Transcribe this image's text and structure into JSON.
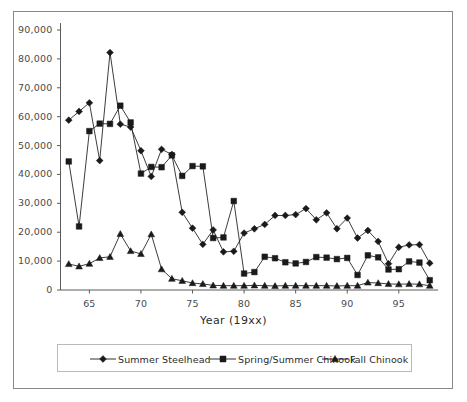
{
  "chart_data": {
    "type": "line",
    "title": "",
    "subtitle": "",
    "xlabel": "Year  (19xx)",
    "ylabel": "",
    "xlim": [
      62.2,
      98.8
    ],
    "ylim": [
      0,
      90000
    ],
    "grid": false,
    "legend_position": "bottom",
    "y_ticks": [
      0,
      10000,
      20000,
      30000,
      40000,
      50000,
      60000,
      70000,
      80000,
      90000
    ],
    "y_tick_labels": [
      "0",
      "10,000",
      "20,000",
      "30,000",
      "40,000",
      "50,000",
      "60,000",
      "70,000",
      "80,000",
      "90,000"
    ],
    "x_ticks": [
      65,
      70,
      75,
      80,
      85,
      90,
      95
    ],
    "x_tick_labels": [
      "65",
      "70",
      "75",
      "80",
      "85",
      "90",
      "95"
    ],
    "x": [
      63,
      64,
      65,
      66,
      67,
      68,
      69,
      70,
      71,
      72,
      73,
      74,
      75,
      76,
      77,
      78,
      79,
      80,
      81,
      82,
      83,
      84,
      85,
      86,
      87,
      88,
      89,
      90,
      91,
      92,
      93,
      94,
      95,
      96,
      97,
      98
    ],
    "series": [
      {
        "name": "Summer Steelhead",
        "marker": "diamond",
        "color": "#1a1a1a",
        "values": [
          58800,
          61800,
          64800,
          44800,
          82200,
          57400,
          56400,
          48200,
          39300,
          48700,
          46900,
          26900,
          21400,
          15800,
          20800,
          13200,
          13400,
          19700,
          21200,
          22700,
          25800,
          25800,
          26100,
          28200,
          24300,
          26700,
          21200,
          24900,
          18000,
          20600,
          16800,
          9100,
          14800,
          15600,
          15700,
          9300
        ]
      },
      {
        "name": "Spring/Summer Chinook",
        "marker": "square",
        "color": "#1a1a1a",
        "values": [
          44500,
          22000,
          55000,
          57600,
          57500,
          63800,
          58000,
          40300,
          42600,
          42500,
          46600,
          39500,
          42900,
          42800,
          18000,
          18200,
          30800,
          5700,
          6200,
          11500,
          11000,
          9600,
          9200,
          9700,
          11400,
          11200,
          10700,
          11100,
          5200,
          12000,
          11300,
          7100,
          7200,
          9900,
          9500,
          3400
        ]
      },
      {
        "name": "Fall Chinook",
        "marker": "triangle",
        "color": "#1a1a1a",
        "values": [
          9000,
          8200,
          9100,
          11100,
          11500,
          19400,
          13500,
          12500,
          19300,
          7200,
          3900,
          3200,
          2400,
          2100,
          1600,
          1500,
          1500,
          1500,
          1600,
          1500,
          1400,
          1500,
          1500,
          1500,
          1500,
          1500,
          1400,
          1500,
          1500,
          2600,
          2400,
          2100,
          2000,
          2100,
          2000,
          1500
        ]
      }
    ]
  },
  "axis": {
    "x_title": "Year  (19xx)"
  },
  "legend": {
    "items": [
      {
        "label": "Summer Steelhead",
        "marker": "diamond"
      },
      {
        "label": "Spring/Summer Chinook",
        "marker": "square"
      },
      {
        "label": "Fall Chinook",
        "marker": "triangle"
      }
    ]
  }
}
